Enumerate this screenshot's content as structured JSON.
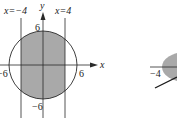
{
  "figure_left": {
    "axes": {
      "x_label": "x",
      "y_label": "y"
    },
    "lines": [
      {
        "equation": "x=−4",
        "label": "x=−4"
      },
      {
        "equation": "x=4",
        "label": "x=4"
      }
    ],
    "circle": {
      "radius": 6,
      "center": [
        0,
        0
      ]
    },
    "tick_labels": {
      "top": "6",
      "bottom": "−6",
      "left": "−6",
      "right": "6"
    },
    "shaded_region": "disk between x=−4 and x=4",
    "colors": {
      "fill": "#a9a9a9",
      "stroke": "#2a2a2a"
    }
  },
  "figure_right": {
    "tick_labels": {
      "left": "−4"
    },
    "colors": {
      "fill": "#a9a9a9",
      "stroke": "#2a2a2a"
    }
  }
}
